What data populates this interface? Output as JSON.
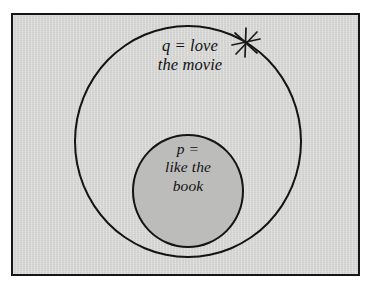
{
  "figure": {
    "background_color": "#d5d5d4",
    "frame_color": "#151515",
    "outline_color": "#141414",
    "inner_fill_color": "#bcbcbb",
    "outer_set": {
      "name": "outer-circle-q",
      "label": "q = love\nthe movie",
      "variable": "q",
      "description": "love the movie"
    },
    "inner_set": {
      "name": "inner-circle-p",
      "label": "p =\nlike the\nbook",
      "variable": "p",
      "description": "like the book"
    },
    "annotations": [
      {
        "name": "asterisk-mark",
        "glyph": "asterisk-icon",
        "placement": "upper-right arc of outer circle"
      }
    ]
  }
}
